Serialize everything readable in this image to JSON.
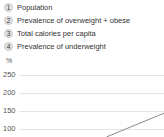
{
  "chart_data": {
    "type": "line",
    "unit_label": "%",
    "legend": [
      {
        "num": "1",
        "label": "Population"
      },
      {
        "num": "2",
        "label": "Prevalence of overweight + obese"
      },
      {
        "num": "3",
        "label": "Total calories per capita"
      },
      {
        "num": "4",
        "label": "Prevalence of underweight"
      }
    ],
    "y_ticks": [
      "250",
      "200",
      "150",
      "100"
    ],
    "y_tick_values": [
      250,
      200,
      150,
      100
    ],
    "grid": true,
    "legend_position": "top-left",
    "visible_line_segment": {
      "note_x_axis_cropped": true,
      "x_fraction": [
        0.65,
        1.0
      ],
      "y_values_pct": [
        78,
        144
      ]
    },
    "colors": {
      "background": "#ffffff",
      "legend_text": "#333333",
      "badge_bg": "#e2e2e2",
      "badge_border": "#c9c9c9",
      "tick_text": "#555555",
      "gridline": "#e4e4e4",
      "line": "#8a8a8a"
    }
  }
}
